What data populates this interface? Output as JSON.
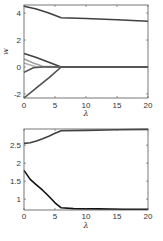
{
  "chart_data": [
    {
      "type": "line",
      "title": "",
      "xlabel": "λ",
      "ylabel": "w",
      "xlim": [
        0,
        20
      ],
      "ylim": [
        -2.3,
        4.6
      ],
      "xticks": [
        0,
        5,
        10,
        15,
        20
      ],
      "xtick_labels": [
        "0",
        "5",
        "10",
        "15",
        "20"
      ],
      "yticks": [
        -2,
        0,
        2,
        4
      ],
      "ytick_labels": [
        "-2",
        "0",
        "2",
        "4"
      ],
      "grid": false,
      "legend": null,
      "series": [
        {
          "name": "w1",
          "color": "#404040",
          "x": [
            0,
            2,
            4,
            6,
            10,
            15,
            20
          ],
          "values": [
            4.5,
            4.3,
            4.0,
            3.65,
            3.6,
            3.5,
            3.4
          ]
        },
        {
          "name": "w2",
          "color": "#404040",
          "x": [
            0,
            2,
            4,
            6,
            10,
            20
          ],
          "values": [
            1.0,
            0.7,
            0.35,
            0.0,
            0.0,
            0.0
          ]
        },
        {
          "name": "w3",
          "color": "#a0a0a0",
          "x": [
            0,
            1.5,
            3,
            6,
            20
          ],
          "values": [
            0.6,
            0.3,
            0.05,
            0.0,
            0.0
          ]
        },
        {
          "name": "w4",
          "color": "#b0b0b0",
          "x": [
            0,
            1,
            2,
            6,
            20
          ],
          "values": [
            0.3,
            0.15,
            0.02,
            0.0,
            0.0
          ]
        },
        {
          "name": "w5",
          "color": "#505050",
          "x": [
            0,
            1.5,
            3,
            6,
            20
          ],
          "values": [
            -0.4,
            -0.05,
            0.0,
            0.0,
            0.0
          ]
        },
        {
          "name": "w6",
          "color": "#505050",
          "x": [
            0,
            2,
            4,
            6,
            10,
            20
          ],
          "values": [
            -2.3,
            -1.55,
            -0.8,
            0.0,
            0.0,
            0.0
          ]
        }
      ]
    },
    {
      "type": "line",
      "title": "",
      "xlabel": "λ",
      "ylabel": "",
      "xlim": [
        0,
        20
      ],
      "ylim": [
        0.7,
        2.95
      ],
      "xticks": [
        0,
        5,
        10,
        15,
        20
      ],
      "xtick_labels": [
        "0",
        "5",
        "10",
        "15",
        "20"
      ],
      "yticks": [
        1,
        1.5,
        2,
        2.5
      ],
      "ytick_labels": [
        "1",
        "1.5",
        "2",
        "2.5"
      ],
      "grid": false,
      "legend": null,
      "series": [
        {
          "name": "upper",
          "color": "#404040",
          "x": [
            0,
            1,
            2,
            3,
            4,
            5,
            6,
            10,
            15,
            20
          ],
          "values": [
            2.55,
            2.57,
            2.62,
            2.68,
            2.75,
            2.83,
            2.9,
            2.91,
            2.93,
            2.94
          ]
        },
        {
          "name": "lower",
          "color": "#111111",
          "x": [
            0,
            1,
            2,
            3,
            4,
            5,
            6,
            8,
            12,
            16,
            20
          ],
          "values": [
            1.8,
            1.55,
            1.4,
            1.25,
            1.08,
            0.9,
            0.76,
            0.74,
            0.73,
            0.72,
            0.72
          ]
        }
      ]
    }
  ]
}
